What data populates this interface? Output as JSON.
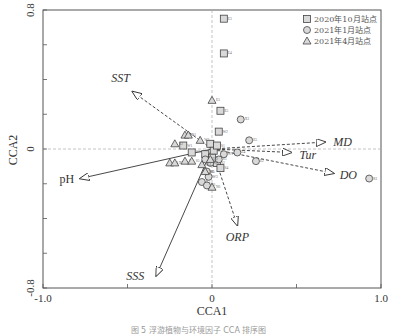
{
  "chart_data": {
    "type": "scatter",
    "title": "",
    "xlabel": "CCA1",
    "ylabel": "CCA2",
    "xlim": [
      -1.0,
      1.0
    ],
    "ylim": [
      -0.8,
      0.8
    ],
    "x_ticks": [
      "-1.0",
      "0",
      "1.0"
    ],
    "y_ticks": [
      "-0.8",
      "0",
      "0.8"
    ],
    "grid": false,
    "legend_position": "top-right",
    "legend": [
      {
        "label": "2020年10月站点",
        "marker": "square"
      },
      {
        "label": "2021年1月站点",
        "marker": "circle"
      },
      {
        "label": "2021年4月站点",
        "marker": "triangle"
      }
    ],
    "env_vectors": [
      {
        "name": "SST",
        "x": -0.47,
        "y": 0.33,
        "style": "dashed"
      },
      {
        "name": "MD",
        "x": 0.67,
        "y": 0.04,
        "style": "dashed"
      },
      {
        "name": "Tur",
        "x": 0.47,
        "y": -0.02,
        "style": "dashed"
      },
      {
        "name": "DO",
        "x": 0.72,
        "y": -0.14,
        "style": "dashed"
      },
      {
        "name": "ORP",
        "x": 0.15,
        "y": -0.44,
        "style": "dashed"
      },
      {
        "name": "pH",
        "x": -0.78,
        "y": -0.17,
        "style": "solid"
      },
      {
        "name": "SSS",
        "x": -0.33,
        "y": -0.73,
        "style": "solid"
      }
    ],
    "series": [
      {
        "name": "2020年10月站点",
        "marker": "square",
        "points": [
          {
            "x": 0.07,
            "y": 0.75,
            "label": "E3"
          },
          {
            "x": 0.07,
            "y": 0.55,
            "label": "E4"
          },
          {
            "x": 0.05,
            "y": 0.22,
            "label": "E5"
          },
          {
            "x": 0.04,
            "y": 0.1,
            "label": "W2"
          },
          {
            "x": -0.01,
            "y": 0.03,
            "label": "W3"
          },
          {
            "x": -0.17,
            "y": 0.02,
            "label": "W1"
          },
          {
            "x": -0.12,
            "y": -0.02,
            "label": "W5"
          },
          {
            "x": -0.04,
            "y": -0.03,
            "label": "W6"
          },
          {
            "x": 0.01,
            "y": -0.01,
            "label": "W4"
          },
          {
            "x": 0.03,
            "y": 0.02,
            "label": "S1"
          },
          {
            "x": 0.03,
            "y": -0.08,
            "label": "S2"
          },
          {
            "x": 0.0,
            "y": -0.05,
            "label": "S3"
          },
          {
            "x": 0.05,
            "y": -0.11,
            "label": "S4"
          }
        ]
      },
      {
        "name": "2021年1月站点",
        "marker": "circle",
        "points": [
          {
            "x": 0.93,
            "y": -0.17,
            "label": "R1"
          },
          {
            "x": 0.17,
            "y": 0.17,
            "label": "X3"
          },
          {
            "x": 0.22,
            "y": 0.05,
            "label": "E5"
          },
          {
            "x": 0.15,
            "y": -0.02,
            "label": "E4"
          },
          {
            "x": 0.26,
            "y": -0.07,
            "label": "E2"
          },
          {
            "x": 0.07,
            "y": -0.03,
            "label": "W1"
          },
          {
            "x": 0.04,
            "y": -0.06,
            "label": "S3"
          },
          {
            "x": -0.04,
            "y": -0.06,
            "label": "W2"
          },
          {
            "x": -0.03,
            "y": -0.13,
            "label": "S5"
          },
          {
            "x": -0.02,
            "y": -0.16,
            "label": "W3"
          },
          {
            "x": -0.06,
            "y": -0.19,
            "label": "X5"
          },
          {
            "x": -0.03,
            "y": -0.21,
            "label": "X6"
          },
          {
            "x": -0.01,
            "y": -0.08,
            "label": "S2"
          }
        ]
      },
      {
        "name": "2021年4月站点",
        "marker": "triangle",
        "points": [
          {
            "x": 0.0,
            "y": 0.28,
            "label": "E5"
          },
          {
            "x": -0.16,
            "y": 0.08,
            "label": "X1"
          },
          {
            "x": -0.14,
            "y": 0.08,
            "label": "S1"
          },
          {
            "x": -0.07,
            "y": 0.05,
            "label": "W3"
          },
          {
            "x": -0.22,
            "y": 0.03,
            "label": "X2"
          },
          {
            "x": -0.25,
            "y": -0.08,
            "label": "X4"
          },
          {
            "x": -0.22,
            "y": -0.08,
            "label": "X5"
          },
          {
            "x": -0.16,
            "y": -0.07,
            "label": "S4"
          },
          {
            "x": -0.12,
            "y": -0.07,
            "label": "S5"
          },
          {
            "x": -0.06,
            "y": -0.09,
            "label": "W4"
          },
          {
            "x": -0.04,
            "y": -0.13,
            "label": "W5"
          },
          {
            "x": -0.01,
            "y": -0.06,
            "label": "S2"
          },
          {
            "x": 0.0,
            "y": -0.22,
            "label": "N6"
          }
        ]
      }
    ]
  },
  "caption": "图 5 浮游植物与环境因子 CCA 排序图"
}
